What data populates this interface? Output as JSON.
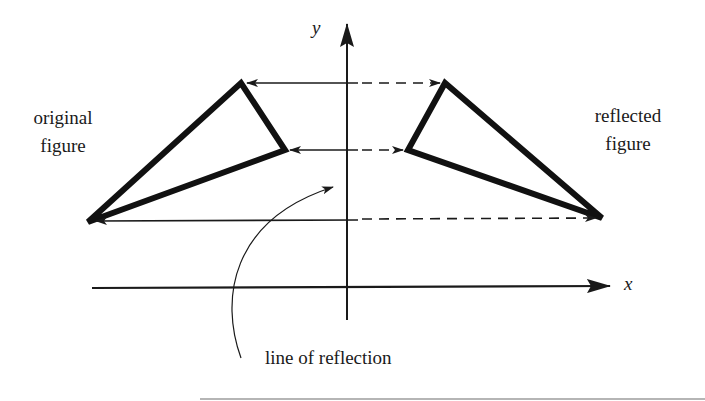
{
  "labels": {
    "original_line1": "original",
    "original_line2": "figure",
    "reflected_line1": "reflected",
    "reflected_line2": "figure",
    "y_axis": "y",
    "x_axis": "x",
    "line_of_reflection": "line of reflection"
  },
  "geometry": {
    "original_triangle": [
      [
        88,
        222
      ],
      [
        241,
        83
      ],
      [
        285,
        150
      ]
    ],
    "reflected_triangle": [
      [
        445,
        83
      ],
      [
        408,
        150
      ],
      [
        602,
        218
      ]
    ],
    "axis_of_reflection": "y-axis"
  },
  "colors": {
    "ink": "#1a1a1a",
    "background": "#ffffff"
  }
}
